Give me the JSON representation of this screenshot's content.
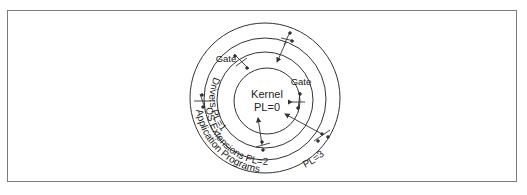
{
  "figure": {
    "rings": [
      {
        "name": "Kernel",
        "level_label": "PL=0"
      },
      {
        "name": "Drivers",
        "level_label": "PL=1"
      },
      {
        "name": "OS Extensions",
        "level_label": "PL=2"
      },
      {
        "name": "Application Programs",
        "level_label": "PL=3"
      }
    ],
    "gates": [
      {
        "label": "Gate"
      },
      {
        "label": "Gate"
      }
    ],
    "colors": {
      "line": "#333333",
      "frame": "#7a7a7a",
      "background": "#ffffff"
    }
  }
}
